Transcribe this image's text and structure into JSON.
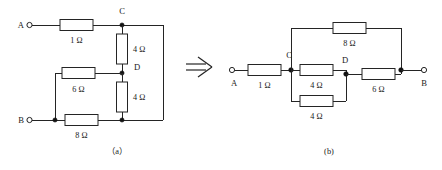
{
  "figure": {
    "transform_symbol": "double-right-arrow",
    "captions": {
      "left": "（a）",
      "right": "(b)"
    }
  },
  "circuit_a": {
    "name": "original-network",
    "terminals": [
      {
        "id": "A",
        "label": "A"
      },
      {
        "id": "B",
        "label": "B"
      }
    ],
    "nodes": [
      {
        "id": "C",
        "label": "C"
      },
      {
        "id": "D",
        "label": "D"
      }
    ],
    "resistors": [
      {
        "id": "a-r1",
        "label": "1 Ω",
        "value": 1,
        "unit": "Ω",
        "orientation": "horizontal",
        "between": "A-C"
      },
      {
        "id": "a-r2",
        "label": "4 Ω",
        "value": 4,
        "unit": "Ω",
        "orientation": "vertical",
        "between": "C-D"
      },
      {
        "id": "a-r3",
        "label": "4 Ω",
        "value": 4,
        "unit": "Ω",
        "orientation": "vertical",
        "between": "D-B"
      },
      {
        "id": "a-r4",
        "label": "6 Ω",
        "value": 6,
        "unit": "Ω",
        "orientation": "horizontal",
        "between": "B-D"
      },
      {
        "id": "a-r5",
        "label": "8 Ω",
        "value": 8,
        "unit": "Ω",
        "orientation": "horizontal",
        "between": "B-C"
      }
    ]
  },
  "circuit_b": {
    "name": "redrawn-network",
    "terminals": [
      {
        "id": "A",
        "label": "A"
      },
      {
        "id": "B",
        "label": "B"
      }
    ],
    "nodes": [
      {
        "id": "C",
        "label": "C"
      },
      {
        "id": "D",
        "label": "D"
      }
    ],
    "resistors": [
      {
        "id": "b-r1",
        "label": "1 Ω",
        "value": 1,
        "unit": "Ω",
        "orientation": "horizontal",
        "between": "A-C"
      },
      {
        "id": "b-r2",
        "label": "8 Ω",
        "value": 8,
        "unit": "Ω",
        "orientation": "horizontal",
        "between": "C-B"
      },
      {
        "id": "b-r3",
        "label": "4 Ω",
        "value": 4,
        "unit": "Ω",
        "orientation": "horizontal",
        "between": "C-D"
      },
      {
        "id": "b-r4",
        "label": "4 Ω",
        "value": 4,
        "unit": "Ω",
        "orientation": "horizontal",
        "between": "C-D"
      },
      {
        "id": "b-r5",
        "label": "6 Ω",
        "value": 6,
        "unit": "Ω",
        "orientation": "horizontal",
        "between": "D-B"
      }
    ]
  }
}
